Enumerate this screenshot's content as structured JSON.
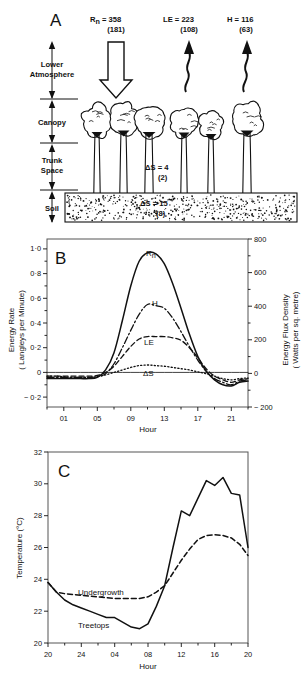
{
  "figure": {
    "background": "#ffffff",
    "ink": "#111111"
  },
  "panelA": {
    "letter": "A",
    "flux_labels": [
      {
        "name": "Rn",
        "symbol": "R",
        "subscript": "n",
        "equals": "= 358",
        "paren": "(181)",
        "direction": "down",
        "arrow": "block-arrow"
      },
      {
        "name": "LE",
        "symbol": "LE",
        "subscript": "",
        "equals": "= 223",
        "paren": "(108)",
        "direction": "up",
        "arrow": "wavy-arrow"
      },
      {
        "name": "H",
        "symbol": "H",
        "subscript": "",
        "equals": "= 116",
        "paren": "(63)",
        "direction": "up",
        "arrow": "wavy-arrow"
      }
    ],
    "layers": [
      {
        "label_line1": "Lower",
        "label_line2": "Atmosphere"
      },
      {
        "label_line1": "Canopy",
        "label_line2": ""
      },
      {
        "label_line1": "Trunk",
        "label_line2": "Space"
      },
      {
        "label_line1": "Soil",
        "label_line2": ""
      }
    ],
    "storage_labels": [
      {
        "text": "ΔS = 4",
        "paren": "(2)",
        "where": "trunk-space"
      },
      {
        "text": "ΔS = 15",
        "paren": "(8)",
        "where": "soil"
      }
    ],
    "tree_count": 6
  },
  "panelB": {
    "letter": "B",
    "ylabel_line1": "Energy Rate",
    "ylabel_line2": "( Langleys per Minute)",
    "ylabel_right_line1": "Energy Flux Density",
    "ylabel_right_line2": "( Watts per sq. metre)",
    "xlabel": "Hour",
    "yticks_left": [
      "1·0",
      "0·8",
      "0·6",
      "0·4",
      "0·2",
      "0",
      "− 0·2"
    ],
    "ytick_values_left": [
      1.0,
      0.8,
      0.6,
      0.4,
      0.2,
      0.0,
      -0.2
    ],
    "yticks_right": [
      "800",
      "600",
      "400",
      "200",
      "0",
      "− 200"
    ],
    "ytick_values_right": [
      800,
      600,
      400,
      200,
      0,
      -200
    ],
    "xticks": [
      "01",
      "05",
      "09",
      "13",
      "17",
      "21"
    ],
    "xtick_values": [
      1,
      5,
      9,
      13,
      17,
      21
    ],
    "curve_labels": [
      "R",
      "H",
      "LE",
      "ΔS"
    ],
    "rn_subscript": "n"
  },
  "panelC": {
    "letter": "C",
    "ylabel": "Temperature (°C)",
    "xlabel": "Hour",
    "yticks": [
      "32",
      "30",
      "28",
      "26",
      "24",
      "22",
      "20"
    ],
    "ytick_values": [
      32,
      30,
      28,
      26,
      24,
      22,
      20
    ],
    "xticks": [
      "20",
      "24",
      "04",
      "08",
      "12",
      "16",
      "20"
    ],
    "xtick_values": [
      20,
      24,
      28,
      32,
      36,
      40,
      44
    ],
    "curve_labels": [
      "Undergrowth",
      "Treetops"
    ]
  },
  "chart_data": [
    {
      "id": "panelB",
      "type": "line",
      "title": "B",
      "xlabel": "Hour",
      "ylabel": "Energy Rate ( Langleys per Minute)",
      "ylabel_secondary": "Energy Flux Density ( Watts per sq. metre)",
      "xlim": [
        -1,
        23
      ],
      "ylim": [
        -0.28,
        1.08
      ],
      "ylim_secondary": [
        -200,
        800
      ],
      "grid": false,
      "legend": "inline-curve-labels",
      "x": [
        -1,
        0,
        1,
        2,
        3,
        4,
        5,
        6,
        7,
        8,
        9,
        10,
        11,
        12,
        13,
        14,
        15,
        16,
        17,
        18,
        19,
        20,
        21,
        22,
        23
      ],
      "series": [
        {
          "name": "Rn",
          "style": "solid",
          "values": [
            -0.05,
            -0.05,
            -0.05,
            -0.05,
            -0.05,
            -0.05,
            -0.04,
            0.02,
            0.16,
            0.42,
            0.7,
            0.9,
            0.97,
            0.96,
            0.88,
            0.72,
            0.52,
            0.31,
            0.13,
            0.01,
            -0.06,
            -0.1,
            -0.11,
            -0.08,
            -0.07
          ]
        },
        {
          "name": "H",
          "style": "dash-dot",
          "values": [
            -0.04,
            -0.04,
            -0.04,
            -0.04,
            -0.04,
            -0.04,
            -0.035,
            -0.01,
            0.07,
            0.2,
            0.34,
            0.47,
            0.55,
            0.54,
            0.52,
            0.44,
            0.33,
            0.21,
            0.1,
            0.01,
            -0.05,
            -0.08,
            -0.1,
            -0.07,
            -0.06
          ]
        },
        {
          "name": "LE",
          "style": "dashed",
          "values": [
            -0.03,
            -0.03,
            -0.03,
            -0.03,
            -0.03,
            -0.03,
            -0.025,
            0.0,
            0.05,
            0.13,
            0.21,
            0.27,
            0.29,
            0.29,
            0.29,
            0.28,
            0.26,
            0.2,
            0.12,
            0.03,
            -0.03,
            -0.06,
            -0.08,
            -0.06,
            -0.05
          ]
        },
        {
          "name": "ΔS",
          "style": "dotted",
          "values": [
            -0.03,
            -0.03,
            -0.035,
            -0.04,
            -0.04,
            -0.04,
            -0.035,
            -0.02,
            0.0,
            0.02,
            0.04,
            0.055,
            0.06,
            0.055,
            0.05,
            0.04,
            0.03,
            0.02,
            0.005,
            -0.01,
            -0.03,
            -0.05,
            -0.06,
            -0.05,
            -0.045
          ]
        },
        {
          "name": "zero-line",
          "style": "solid-thin",
          "values": [
            0,
            0,
            0,
            0,
            0,
            0,
            0,
            0,
            0,
            0,
            0,
            0,
            0,
            0,
            0,
            0,
            0,
            0,
            0,
            0,
            0,
            0,
            0,
            0,
            0
          ]
        }
      ]
    },
    {
      "id": "panelC",
      "type": "line",
      "title": "C",
      "xlabel": "Hour",
      "ylabel": "Temperature (°C)",
      "xlim": [
        20,
        44
      ],
      "ylim": [
        20,
        32
      ],
      "grid": false,
      "legend": "inline-curve-labels",
      "x": [
        20,
        21,
        22,
        23,
        24,
        25,
        26,
        27,
        28,
        29,
        30,
        31,
        32,
        33,
        34,
        35,
        36,
        37,
        38,
        39,
        40,
        41,
        42,
        43,
        44
      ],
      "series": [
        {
          "name": "Treetops",
          "style": "solid",
          "values": [
            23.8,
            23.2,
            22.7,
            22.4,
            22.2,
            22.0,
            21.8,
            21.6,
            21.6,
            21.3,
            21.0,
            20.9,
            21.2,
            22.3,
            23.6,
            26.0,
            28.3,
            28.0,
            29.1,
            30.2,
            29.9,
            30.4,
            29.4,
            29.3,
            26.0
          ]
        },
        {
          "name": "Undergrowth",
          "style": "dashed",
          "values": [
            23.8,
            23.2,
            23.1,
            23.05,
            23.0,
            22.95,
            22.9,
            22.85,
            22.8,
            22.8,
            22.8,
            22.8,
            22.9,
            23.2,
            23.6,
            24.4,
            25.2,
            25.9,
            26.5,
            26.75,
            26.8,
            26.75,
            26.6,
            26.2,
            25.5
          ]
        }
      ]
    }
  ]
}
